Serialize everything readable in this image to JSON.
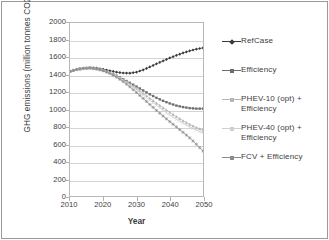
{
  "chart_data": {
    "type": "line",
    "title": "",
    "xlabel": "Year",
    "ylabel": "GHG emissions (million tonnes CO2e per year)",
    "xlim": [
      2010,
      2050
    ],
    "ylim": [
      0,
      2000
    ],
    "xticks": [
      "2010",
      "2020",
      "2030",
      "2040",
      "2050"
    ],
    "yticks": [
      "0",
      "200",
      "400",
      "600",
      "800",
      "1000",
      "1200",
      "1400",
      "1600",
      "1800",
      "2000"
    ],
    "grid": "horizontal",
    "legend_position": "right",
    "x": [
      2010,
      2012,
      2014,
      2016,
      2018,
      2020,
      2022,
      2024,
      2026,
      2028,
      2030,
      2032,
      2034,
      2036,
      2038,
      2040,
      2042,
      2044,
      2046,
      2048,
      2050
    ],
    "series": [
      {
        "name": "RefCase",
        "color": "#3a3a3a",
        "marker": "diamond",
        "values": [
          1440,
          1462,
          1476,
          1483,
          1478,
          1465,
          1448,
          1432,
          1422,
          1420,
          1432,
          1458,
          1492,
          1528,
          1562,
          1596,
          1626,
          1654,
          1678,
          1698,
          1712
        ]
      },
      {
        "name": "Efficiency",
        "color": "#6e6e6e",
        "marker": "square",
        "values": [
          1440,
          1462,
          1476,
          1480,
          1470,
          1452,
          1424,
          1390,
          1350,
          1308,
          1265,
          1220,
          1176,
          1135,
          1100,
          1070,
          1045,
          1028,
          1016,
          1010,
          1010
        ]
      },
      {
        "name": "PHEV-10 (opt) + Efficiency",
        "color": "#b5b5b5",
        "marker": "triangle",
        "values": [
          1440,
          1462,
          1476,
          1480,
          1470,
          1452,
          1424,
          1388,
          1344,
          1296,
          1244,
          1188,
          1130,
          1074,
          1020,
          968,
          918,
          870,
          828,
          792,
          762
        ]
      },
      {
        "name": "PHEV-40 (opt) + Efficiency",
        "color": "#cfcfcf",
        "marker": "cross",
        "values": [
          1440,
          1462,
          1476,
          1480,
          1470,
          1452,
          1422,
          1384,
          1338,
          1286,
          1230,
          1170,
          1108,
          1048,
          990,
          936,
          886,
          840,
          800,
          762,
          730
        ]
      },
      {
        "name": "FCV + Efficiency",
        "color": "#8c8c8c",
        "marker": "star",
        "values": [
          1440,
          1462,
          1476,
          1480,
          1468,
          1448,
          1416,
          1374,
          1322,
          1262,
          1196,
          1128,
          1058,
          990,
          924,
          860,
          798,
          736,
          672,
          598,
          520
        ]
      }
    ]
  },
  "legend": {
    "items": [
      {
        "label": "RefCase"
      },
      {
        "label": "Efficiency"
      },
      {
        "label": "PHEV-10 (opt) +\nEfficiency"
      },
      {
        "label": "PHEV-40 (opt) +\nEfficiency"
      },
      {
        "label": "FCV + Efficiency"
      }
    ]
  }
}
